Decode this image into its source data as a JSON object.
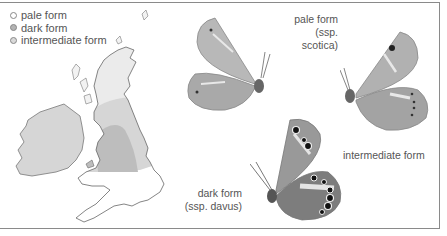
{
  "legend": {
    "items": [
      {
        "label": "pale form",
        "color": "#ffffff"
      },
      {
        "label": "dark form",
        "color": "#b3b3b3"
      },
      {
        "label": "intermediate form",
        "color": "#d9d9d9"
      }
    ]
  },
  "map": {
    "region": "British Isles",
    "zones": [
      {
        "name": "pale form",
        "area": "Scotland",
        "color": "#ebebeb"
      },
      {
        "name": "intermediate form",
        "area": "Northern England, Ireland",
        "color": "#d6d6d6"
      },
      {
        "name": "dark form",
        "area": "North-west England / Wales border",
        "color": "#bdbdbd"
      }
    ]
  },
  "butterflies": [
    {
      "id": "pale",
      "title": "pale form",
      "subtitle": "(ssp. scotica)"
    },
    {
      "id": "intermediate",
      "title": "intermediate form",
      "subtitle": ""
    },
    {
      "id": "dark",
      "title": "dark form",
      "subtitle": "(ssp. davus)"
    }
  ]
}
